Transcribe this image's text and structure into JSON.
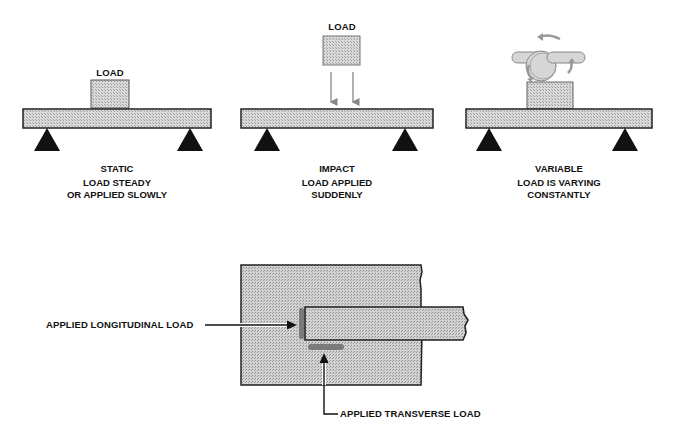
{
  "panels": [
    {
      "id": "static",
      "load_label": "LOAD",
      "title": "STATIC",
      "description_line1": "LOAD STEADY",
      "description_line2": "OR APPLIED SLOWLY"
    },
    {
      "id": "impact",
      "load_label": "LOAD",
      "title": "IMPACT",
      "description_line1": "LOAD APPLIED",
      "description_line2": "SUDDENLY"
    },
    {
      "id": "variable",
      "title": "VARIABLE",
      "description_line1": "LOAD IS VARYING",
      "description_line2": "CONSTANTLY"
    }
  ],
  "joint_diagram": {
    "longitudinal_label": "APPLIED LONGITUDINAL LOAD",
    "transverse_label": "APPLIED TRANSVERSE LOAD"
  },
  "colors": {
    "hatch_fill": "#cfcfcf",
    "outline": "#222222",
    "support": "#111111",
    "arrow_gray": "#888888",
    "weld_gray": "#777777"
  }
}
